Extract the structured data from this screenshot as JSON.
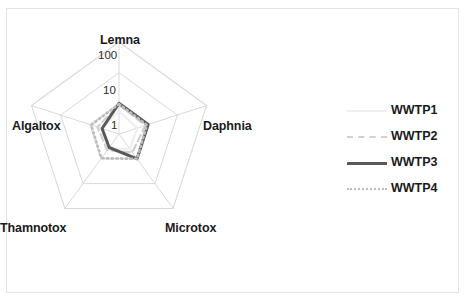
{
  "frame": {
    "border_color": "#e3e3e3",
    "background": "#ffffff"
  },
  "chart_data": {
    "type": "radar",
    "title": "",
    "scale": "log",
    "radial_ticks": [
      "1",
      "10",
      "100"
    ],
    "radial_tick_values": [
      1,
      10,
      100
    ],
    "rlim": [
      0.1,
      100
    ],
    "grid": true,
    "legend_position": "right",
    "categories": [
      "Lemna",
      "Daphnia",
      "Microtox",
      "Thamnotox",
      "Algaltox"
    ],
    "series": [
      {
        "name": "WWTP1",
        "style": "solid",
        "color": "#efefef",
        "width": 2.2,
        "values": [
          0.55,
          0.42,
          0.4,
          0.38,
          0.4
        ]
      },
      {
        "name": "WWTP2",
        "style": "dashed",
        "color": "#d0d0d0",
        "width": 2.2,
        "values": [
          0.9,
          0.8,
          0.55,
          0.45,
          0.55
        ]
      },
      {
        "name": "WWTP3",
        "style": "solid",
        "color": "#595959",
        "width": 3.0,
        "values": [
          1.0,
          1.0,
          1.0,
          0.35,
          0.38
        ]
      },
      {
        "name": "WWTP4",
        "style": "dotted",
        "color": "#bdbdbd",
        "width": 2.6,
        "values": [
          0.95,
          0.9,
          1.0,
          0.95,
          0.9
        ]
      }
    ],
    "grid_color": "#d9d9d9",
    "spoke_color": "#d9d9d9"
  },
  "axis_labels": {
    "lemna": "Lemna",
    "daphnia": "Daphnia",
    "microtox": "Microtox",
    "thamnotox": "Thamnotox",
    "algaltox": "Algaltox"
  },
  "ticks": {
    "outer": "100",
    "middle": "10",
    "inner": "1"
  },
  "legend": {
    "items": [
      {
        "label": "WWTP1"
      },
      {
        "label": "WWTP2"
      },
      {
        "label": "WWTP3"
      },
      {
        "label": "WWTP4"
      }
    ]
  }
}
